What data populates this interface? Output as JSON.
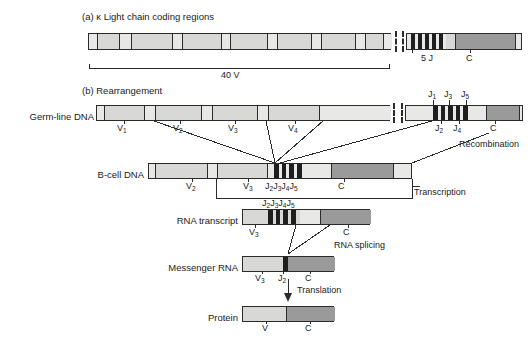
{
  "figure": {
    "panel_a": {
      "title": "(a) κ Light chain coding regions",
      "v_bracket_label": "40 V",
      "j_label": "5 J",
      "c_label": "C"
    },
    "panel_b": {
      "title": "(b) Rearrangement",
      "rows": [
        {
          "label": "Germ-line DNA"
        },
        {
          "label": "B-cell DNA"
        },
        {
          "label": "RNA transcript"
        },
        {
          "label": "Messenger RNA"
        },
        {
          "label": "Protein"
        }
      ],
      "process_labels": {
        "recombination": "Recombination",
        "transcription": "Transcription",
        "rna_splicing": "RNA splicing",
        "translation": "Translation"
      },
      "germline_labels": {
        "v": [
          "V",
          "V",
          "V",
          "V"
        ],
        "v_subs": [
          "1",
          "2",
          "3",
          "4"
        ],
        "j_top": [
          {
            "base": "J",
            "sub": "1"
          },
          {
            "base": "J",
            "sub": "3"
          },
          {
            "base": "J",
            "sub": "5"
          }
        ],
        "j_bottom": [
          {
            "base": "J",
            "sub": "2"
          },
          {
            "base": "J",
            "sub": "4"
          }
        ],
        "c": "C"
      },
      "bcell_labels": {
        "v2": {
          "base": "V",
          "sub": "2"
        },
        "v3": {
          "base": "V",
          "sub": "3"
        },
        "j_group": "J2J3J4J5",
        "c": "C"
      },
      "transcript_labels": {
        "j_group_top": "J2J3J4J5",
        "j_group_inline": "J2J3J4J5",
        "v3": {
          "base": "V",
          "sub": "3"
        },
        "c": "C"
      },
      "mrna_labels": {
        "v3": {
          "base": "V",
          "sub": "3"
        },
        "j2": {
          "base": "J",
          "sub": "2"
        },
        "c": "C"
      },
      "protein_labels": {
        "v": "V",
        "c": "C"
      }
    },
    "colors": {
      "v_segment": "#d8d8d6",
      "v_spacer": "#e8e8e6",
      "c_segment": "#9a9a9a",
      "j_segment": "#1e1e1e",
      "outline": "#2b2b2b",
      "text": "#1a1a1a",
      "background": "#ffffff"
    }
  }
}
